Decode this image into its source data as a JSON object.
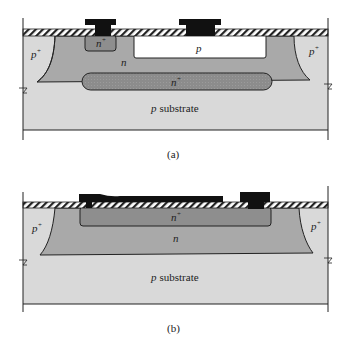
{
  "figure_a": {
    "caption": "(a)",
    "labels": {
      "p_plus_left": "p",
      "p_plus_left_sup": "+",
      "p_plus_right": "p",
      "p_plus_right_sup": "+",
      "n_plus_small": "n",
      "n_plus_small_sup": "+",
      "p_region": "p",
      "n_region": "n",
      "n_plus_buried": "n",
      "n_plus_buried_sup": "+",
      "substrate_italic": "p",
      "substrate_text": "substrate"
    }
  },
  "figure_b": {
    "caption": "(b)",
    "labels": {
      "p_plus_left": "p",
      "p_plus_left_sup": "+",
      "p_plus_right": "p",
      "p_plus_right_sup": "+",
      "n_plus": "n",
      "n_plus_sup": "+",
      "n_region": "n",
      "substrate_italic": "p",
      "substrate_text": "substrate"
    }
  },
  "colors": {
    "substrate": "#d9d9d9",
    "n_region": "#a9a9a9",
    "n_plus": "#8e8e8e",
    "p_region": "#ffffff",
    "metal": "#111111",
    "outline": "#222222"
  }
}
